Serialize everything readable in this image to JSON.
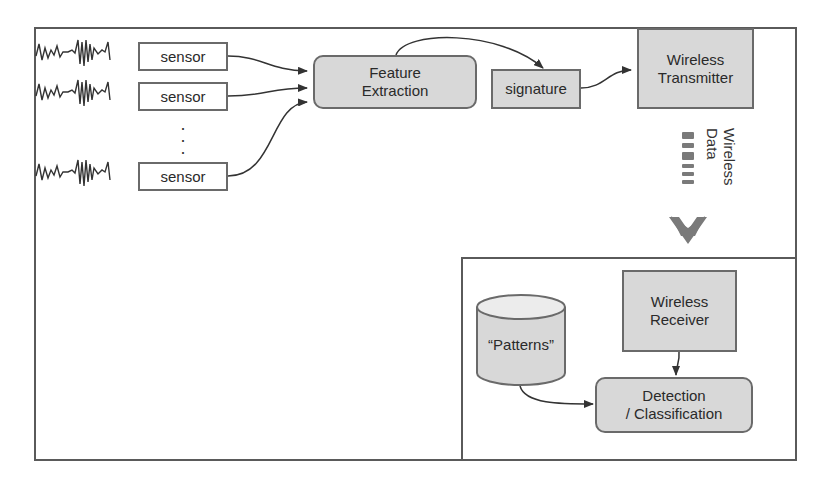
{
  "diagram": {
    "sensors": [
      {
        "label": "sensor"
      },
      {
        "label": "sensor"
      },
      {
        "label": "sensor"
      }
    ],
    "ellipsis": "·\n·\n·",
    "feature_extraction": {
      "line1": "Feature",
      "line2": "Extraction"
    },
    "signature": {
      "label": "signature"
    },
    "transmitter": {
      "line1": "Wireless",
      "line2": "Transmitter"
    },
    "wireless_data": {
      "line1": "Wireless",
      "line2": "Data"
    },
    "receiver": {
      "line1": "Wireless",
      "line2": "Receiver"
    },
    "patterns": {
      "label": "“Patterns”"
    },
    "detection": {
      "line1": "Detection",
      "line2": "/ Classification"
    },
    "colors": {
      "box_fill": "#d8d8d8",
      "border": "#6a6a6a",
      "frame": "#5a5a5a",
      "arrow": "#333333",
      "chevron": "#7a7a7a"
    }
  }
}
